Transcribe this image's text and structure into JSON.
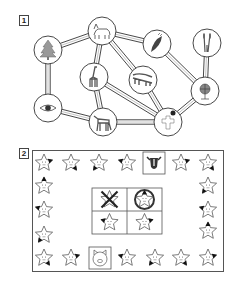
{
  "section1": {
    "label": "1",
    "nodes": [
      {
        "id": "tree",
        "icon": "tree-icon",
        "cx": 48,
        "cy": 50
      },
      {
        "id": "fox",
        "icon": "fox-icon",
        "cx": 102,
        "cy": 31
      },
      {
        "id": "leaf",
        "icon": "leaf-icon",
        "cx": 157,
        "cy": 44
      },
      {
        "id": "reeds",
        "icon": "reeds-icon",
        "cx": 207,
        "cy": 43
      },
      {
        "id": "giraffe",
        "icon": "giraffe-icon",
        "cx": 94,
        "cy": 77
      },
      {
        "id": "crocodile",
        "icon": "crocodile-icon",
        "cx": 143,
        "cy": 80
      },
      {
        "id": "globe",
        "icon": "globe-icon",
        "cx": 205,
        "cy": 91
      },
      {
        "id": "eye",
        "icon": "eye-icon",
        "cx": 48,
        "cy": 108
      },
      {
        "id": "horse",
        "icon": "horse-icon",
        "cx": 103,
        "cy": 122
      },
      {
        "id": "cross",
        "icon": "cross-icon",
        "cx": 168,
        "cy": 122
      }
    ],
    "edges": [
      [
        "tree",
        "fox"
      ],
      [
        "tree",
        "eye"
      ],
      [
        "fox",
        "leaf"
      ],
      [
        "fox",
        "giraffe"
      ],
      [
        "fox",
        "crocodile"
      ],
      [
        "leaf",
        "globe"
      ],
      [
        "reeds",
        "globe"
      ],
      [
        "globe",
        "cross"
      ],
      [
        "giraffe",
        "horse"
      ],
      [
        "giraffe",
        "cross"
      ],
      [
        "crocodile",
        "cross"
      ],
      [
        "eye",
        "horse"
      ],
      [
        "horse",
        "cross"
      ]
    ]
  },
  "section2": {
    "label": "2",
    "stars": [
      {
        "x": 44,
        "y": 163,
        "mark": "r"
      },
      {
        "x": 71,
        "y": 163,
        "mark": "br"
      },
      {
        "x": 99,
        "y": 163,
        "mark": "bl"
      },
      {
        "x": 127,
        "y": 163,
        "mark": "l"
      },
      {
        "x": 181,
        "y": 163,
        "mark": "r"
      },
      {
        "x": 208,
        "y": 163,
        "mark": "br"
      },
      {
        "x": 44,
        "y": 186,
        "mark": "t"
      },
      {
        "x": 44,
        "y": 210,
        "mark": "l"
      },
      {
        "x": 44,
        "y": 235,
        "mark": "bl"
      },
      {
        "x": 208,
        "y": 186,
        "mark": "bl"
      },
      {
        "x": 208,
        "y": 210,
        "mark": "l"
      },
      {
        "x": 208,
        "y": 231,
        "mark": "t"
      },
      {
        "x": 44,
        "y": 258,
        "mark": "br"
      },
      {
        "x": 71,
        "y": 258,
        "mark": "r"
      },
      {
        "x": 127,
        "y": 258,
        "mark": "l"
      },
      {
        "x": 155,
        "y": 258,
        "mark": "bl"
      },
      {
        "x": 181,
        "y": 258,
        "mark": "br"
      },
      {
        "x": 208,
        "y": 258,
        "mark": "r"
      }
    ],
    "special_cells": [
      {
        "id": "cow",
        "icon": "cow-icon",
        "x": 143,
        "y": 152,
        "w": 22,
        "h": 22
      },
      {
        "id": "pig",
        "icon": "pig-icon",
        "x": 89,
        "y": 247,
        "w": 22,
        "h": 22
      }
    ],
    "center_grid": [
      {
        "id": "crossed-star",
        "icon": "crossed-star-icon"
      },
      {
        "id": "ringed-star",
        "icon": "ringed-star-icon"
      },
      {
        "id": "star-left",
        "icon": "star-icon",
        "mark": "l"
      },
      {
        "id": "star-right",
        "icon": "star-icon",
        "mark": "r"
      }
    ]
  }
}
